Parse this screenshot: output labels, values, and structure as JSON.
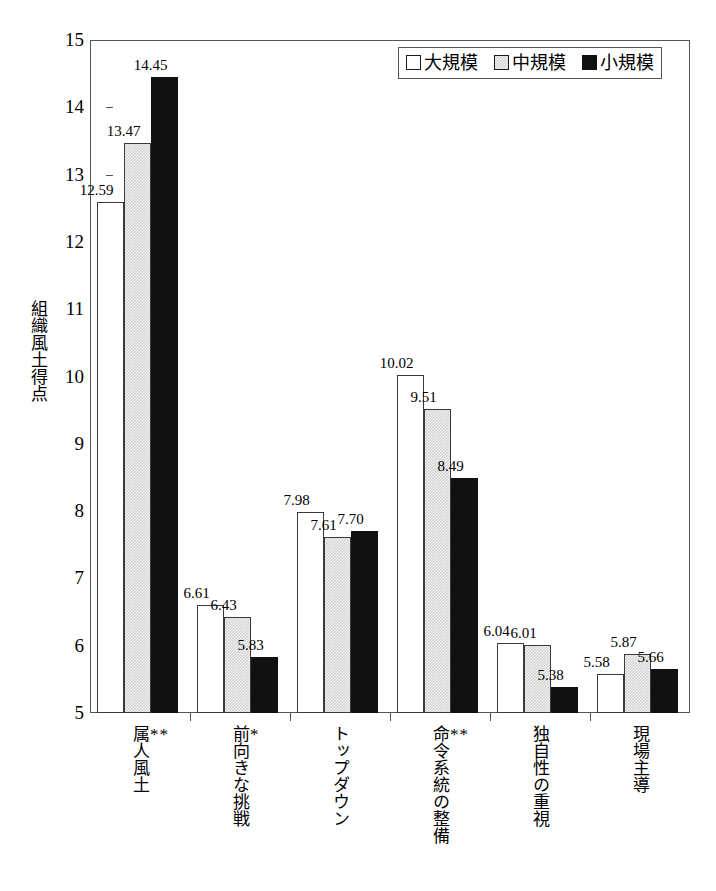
{
  "chart_data": {
    "type": "bar",
    "title": "",
    "xlabel": "",
    "ylabel": "組織風土得点",
    "ylim": [
      5,
      15
    ],
    "yticks": [
      5,
      6,
      7,
      8,
      9,
      10,
      11,
      12,
      13,
      14,
      15
    ],
    "grid": false,
    "legend_position": "top-right",
    "categories": [
      "属人風土",
      "前向きな挑戦",
      "トップダウン",
      "命令系統の整備",
      "独自性の重視",
      "現場主導"
    ],
    "category_significance": [
      "**",
      "*",
      "",
      "**",
      "",
      ""
    ],
    "series": [
      {
        "name": "大規模",
        "fill": "white",
        "values": [
          12.59,
          6.61,
          7.98,
          10.02,
          6.04,
          5.58
        ]
      },
      {
        "name": "中規模",
        "fill": "gray",
        "values": [
          13.47,
          6.43,
          7.61,
          9.51,
          6.01,
          5.87
        ]
      },
      {
        "name": "小規模",
        "fill": "black",
        "values": [
          14.45,
          5.83,
          7.7,
          8.49,
          5.38,
          5.66
        ]
      }
    ],
    "value_labels": [
      [
        "12.59",
        "13.47",
        "14.45"
      ],
      [
        "6.61",
        "6.43",
        "5.83"
      ],
      [
        "7.98",
        "7.61",
        "7.70"
      ],
      [
        "10.02",
        "9.51",
        "8.49"
      ],
      [
        "6.04",
        "6.01",
        "5.38"
      ],
      [
        "5.58",
        "5.87",
        "5.66"
      ]
    ]
  },
  "legend": {
    "items": [
      {
        "label": "大規模",
        "swatch": "legend-swatch-white"
      },
      {
        "label": "中規模",
        "swatch": "legend-swatch-gray"
      },
      {
        "label": "小規模",
        "swatch": "legend-swatch-black"
      }
    ]
  },
  "colors": {
    "axis": "#555555",
    "bar_outline": "#3a3a3a",
    "series_large": "#ffffff",
    "series_medium": "#d2d2d2",
    "series_small": "#111111",
    "text": "#000000"
  }
}
